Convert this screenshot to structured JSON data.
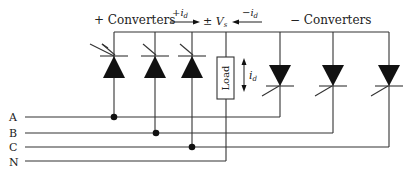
{
  "diagram": {
    "labels": {
      "plus_converters": "+  Converters",
      "minus_converters": "−  Converters",
      "plus_id": "+i",
      "minus_id": "−i",
      "sub_d": "d",
      "vs": "± V",
      "sub_s": "s",
      "load": "Load",
      "load_current": "i"
    },
    "phases": [
      "A",
      "B",
      "C",
      "N"
    ],
    "positive_thyristors": 3,
    "negative_thyristors": 3,
    "colors": {
      "line": "#333333",
      "fill": "#111111",
      "text": "#222222"
    }
  }
}
